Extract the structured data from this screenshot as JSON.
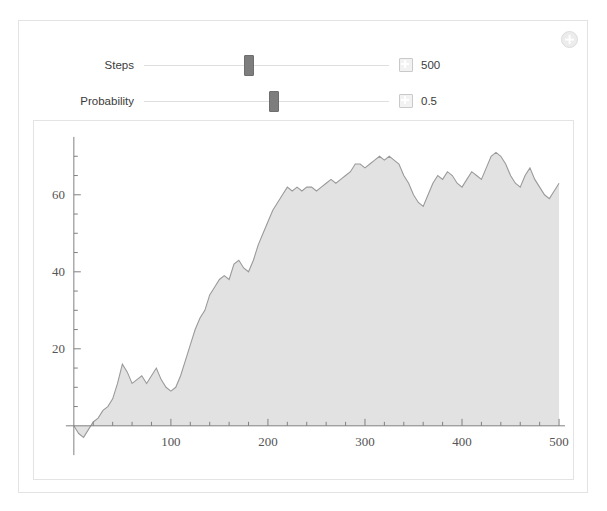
{
  "panel": {
    "corner_action_icon": "circle-plus-icon"
  },
  "controls": [
    {
      "label": "Steps",
      "value": "500",
      "thumb_percent": 43,
      "expand_icon": "plus-square-icon"
    },
    {
      "label": "Probability",
      "value": "0.5",
      "thumb_percent": 53,
      "expand_icon": "plus-square-icon"
    }
  ],
  "chart_data": {
    "type": "area",
    "title": "",
    "subtitle": "",
    "xlabel": "",
    "ylabel": "",
    "xlim": [
      0,
      500
    ],
    "ylim": [
      -4,
      74
    ],
    "grid": false,
    "legend": false,
    "x_ticks": [
      100,
      200,
      300,
      400,
      500
    ],
    "y_ticks": [
      20,
      40,
      60
    ],
    "x_minor_step": 20,
    "y_minor_step": 5,
    "series": [
      {
        "name": "random walk",
        "fill_color": "#e2e2e2",
        "line_color": "#9a9a9a",
        "x": [
          0,
          5,
          10,
          15,
          20,
          25,
          30,
          35,
          40,
          45,
          50,
          55,
          60,
          65,
          70,
          75,
          80,
          85,
          90,
          95,
          100,
          105,
          110,
          115,
          120,
          125,
          130,
          135,
          140,
          145,
          150,
          155,
          160,
          165,
          170,
          175,
          180,
          185,
          190,
          195,
          200,
          205,
          210,
          215,
          220,
          225,
          230,
          235,
          240,
          245,
          250,
          255,
          260,
          265,
          270,
          275,
          280,
          285,
          290,
          295,
          300,
          305,
          310,
          315,
          320,
          325,
          330,
          335,
          340,
          345,
          350,
          355,
          360,
          365,
          370,
          375,
          380,
          385,
          390,
          395,
          400,
          405,
          410,
          415,
          420,
          425,
          430,
          435,
          440,
          445,
          450,
          455,
          460,
          465,
          470,
          475,
          480,
          485,
          490,
          495,
          500
        ],
        "values": [
          0,
          -2,
          -3,
          -1,
          1,
          2,
          4,
          5,
          7,
          11,
          16,
          14,
          11,
          12,
          13,
          11,
          13,
          15,
          12,
          10,
          9,
          10,
          13,
          17,
          21,
          25,
          28,
          30,
          34,
          36,
          38,
          39,
          38,
          42,
          43,
          41,
          40,
          43,
          47,
          50,
          53,
          56,
          58,
          60,
          62,
          61,
          62,
          61,
          62,
          62,
          61,
          62,
          63,
          64,
          63,
          64,
          65,
          66,
          68,
          68,
          67,
          68,
          69,
          70,
          69,
          70,
          69,
          68,
          65,
          63,
          60,
          58,
          57,
          60,
          63,
          65,
          64,
          66,
          65,
          63,
          62,
          64,
          66,
          65,
          64,
          67,
          70,
          71,
          70,
          68,
          65,
          63,
          62,
          65,
          67,
          64,
          62,
          60,
          59,
          61,
          63
        ]
      }
    ]
  }
}
